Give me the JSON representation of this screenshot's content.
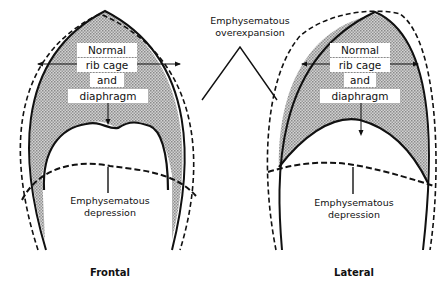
{
  "diagram": {
    "callouts": {
      "overexpansion_line1": "Emphysematous",
      "overexpansion_line2": "overexpansion"
    },
    "frontal": {
      "title": "Frontal",
      "normal_labels": [
        "Normal",
        "rib cage",
        "and",
        "diaphragm"
      ],
      "depression_line1": "Emphysematous",
      "depression_line2": "depression"
    },
    "lateral": {
      "title": "Lateral",
      "normal_labels": [
        "Normal",
        "rib cage",
        "and",
        "diaphragm"
      ],
      "depression_line1": "Emphysematous",
      "depression_line2": "depression"
    },
    "colors": {
      "stroke": "#111111",
      "hatch_fill": "#b8b8b8",
      "background": "#ffffff"
    }
  }
}
